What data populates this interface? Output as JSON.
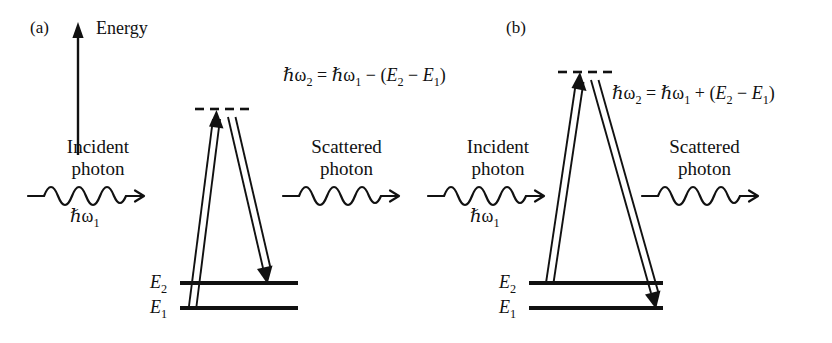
{
  "figure": {
    "background_color": "#ffffff",
    "ink_color": "#111111",
    "width": 832,
    "height": 343
  },
  "panels": [
    {
      "id": "a",
      "label": "(a)",
      "process": "Stokes Raman scattering",
      "axis": {
        "label": "Energy",
        "direction": "up",
        "shown": true
      },
      "formula": {
        "lhs": "ħω2",
        "equals": "=",
        "rhs": "ħω1 − (E2 − E1)",
        "full": "ħω2 = ħω1 − (E2 − E1)",
        "sign": "−"
      },
      "incident": {
        "line1": "Incident",
        "line2": "photon",
        "energy": "ħω1"
      },
      "scattered": {
        "line1": "Scattered",
        "line2": "photon",
        "energy": ""
      },
      "levels": [
        {
          "name": "E2",
          "label": "E",
          "sub": "2"
        },
        {
          "name": "E1",
          "label": "E",
          "sub": "1"
        }
      ],
      "virtual_level": {
        "style": "dashed",
        "dash_count": 4
      },
      "transitions": [
        {
          "name": "absorption",
          "from": "E1",
          "to": "virtual",
          "direction": "up"
        },
        {
          "name": "emission",
          "from": "virtual",
          "to": "E2",
          "direction": "down"
        }
      ]
    },
    {
      "id": "b",
      "label": "(b)",
      "process": "Anti-Stokes Raman scattering",
      "axis": {
        "label": "",
        "direction": "",
        "shown": false
      },
      "formula": {
        "lhs": "ħω2",
        "equals": "=",
        "rhs": "ħω1 + (E2 − E1)",
        "full": "ħω2 = ħω1 + (E2 − E1)",
        "sign": "+"
      },
      "incident": {
        "line1": "Incident",
        "line2": "photon",
        "energy": "ħω1"
      },
      "scattered": {
        "line1": "Scattered",
        "line2": "photon",
        "energy": ""
      },
      "levels": [
        {
          "name": "E2",
          "label": "E",
          "sub": "2"
        },
        {
          "name": "E1",
          "label": "E",
          "sub": "1"
        }
      ],
      "virtual_level": {
        "style": "dashed",
        "dash_count": 4
      },
      "transitions": [
        {
          "name": "absorption",
          "from": "E2",
          "to": "virtual",
          "direction": "up"
        },
        {
          "name": "emission",
          "from": "virtual",
          "to": "E1",
          "direction": "down"
        }
      ]
    }
  ]
}
